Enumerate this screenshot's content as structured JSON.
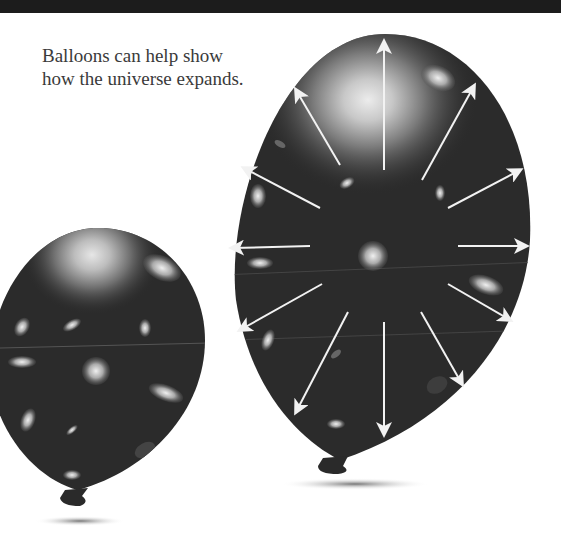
{
  "caption": {
    "line1": "Balloons can help show",
    "line2": "how the universe expands."
  },
  "illustration": {
    "balloons": [
      {
        "name": "small-balloon",
        "description": "smaller balloon with galaxies printed on it"
      },
      {
        "name": "large-balloon",
        "description": "larger inflated balloon with galaxies and outward arrows",
        "arrow_count": 12
      }
    ],
    "colors": {
      "balloon": "#2b2b2b",
      "balloon_edge": "#1a1a1a",
      "glow": "#d8d8d8",
      "arrow": "#f2f2f2",
      "top_strip": "#1c1c1c",
      "text": "#3a3a3a"
    }
  }
}
